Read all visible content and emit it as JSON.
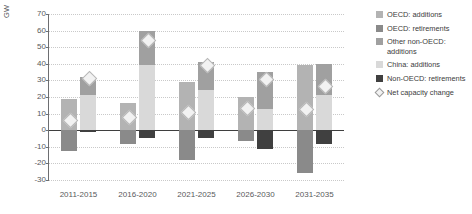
{
  "axis": {
    "ylabel": "GW",
    "yticks": [
      "70",
      "60",
      "50",
      "40",
      "30",
      "20",
      "10",
      "0",
      "-10",
      "-20",
      "-30"
    ],
    "xticks": [
      "2011-2015",
      "2016-2020",
      "2021-2025",
      "2026-2030",
      "2031-2035"
    ]
  },
  "legend": {
    "items": [
      {
        "label": "OECD: additions",
        "color": "#b3b3b3",
        "type": "swatch"
      },
      {
        "label": "OECD: retirements",
        "color": "#8a8a8a",
        "type": "swatch"
      },
      {
        "label": "Other non-OECD: additions",
        "color": "#a0a0a0",
        "type": "swatch"
      },
      {
        "label": "China: additions",
        "color": "#d9d9d9",
        "type": "swatch"
      },
      {
        "label": "Non-OECD: retirements",
        "color": "#404040",
        "type": "swatch"
      },
      {
        "label": "Net capacity change",
        "color": "#f2f2f2",
        "type": "diamond"
      }
    ]
  },
  "chart_data": {
    "type": "bar",
    "title": "",
    "xlabel": "",
    "ylabel": "GW",
    "ylim": [
      -30,
      70
    ],
    "grid": true,
    "legend_position": "right",
    "categories": [
      "2011-2015",
      "2016-2020",
      "2021-2025",
      "2026-2030",
      "2031-2035"
    ],
    "series": [
      {
        "name": "OECD: additions",
        "group": "OECD",
        "values": [
          19,
          16.5,
          29,
          20,
          39
        ]
      },
      {
        "name": "OECD: retirements",
        "group": "OECD",
        "values": [
          -12.5,
          -8.5,
          -18,
          -6.5,
          -26
        ]
      },
      {
        "name": "Other non-OECD: additions",
        "group": "non-OECD",
        "values": [
          11,
          20,
          17,
          22,
          19
        ]
      },
      {
        "name": "China: additions",
        "group": "non-OECD",
        "values": [
          21,
          39.5,
          24,
          13,
          21
        ]
      },
      {
        "name": "Non-OECD: retirements",
        "group": "non-OECD",
        "values": [
          -0.8,
          -5,
          -5,
          -11.5,
          -8.5
        ]
      }
    ],
    "net_capacity_change": [
      {
        "category": "2011-2015",
        "OECD": 6.5,
        "non_OECD": 31.5
      },
      {
        "category": "2016-2020",
        "OECD": 8.0,
        "non_OECD": 54.5
      },
      {
        "category": "2021-2025",
        "OECD": 11.0,
        "non_OECD": 39.5
      },
      {
        "category": "2026-2030",
        "OECD": 13.5,
        "non_OECD": 31.0
      },
      {
        "category": "2031-2035",
        "OECD": 13.0,
        "non_OECD": 27.0
      }
    ]
  }
}
